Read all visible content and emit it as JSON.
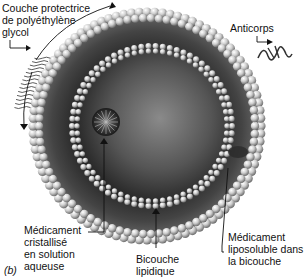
{
  "figure": {
    "panel_label": "(b)"
  },
  "labels": {
    "peg_layer": "Couche protectrice\nde polyéthylène\nglycol",
    "antibody": "Anticorps",
    "drug_aqueous": "Médicament\ncristallisé\nen solution\naqueuse",
    "bilayer": "Bicouche\nlipidique",
    "drug_lipophilic": "Médicament\nliposoluble dans\nla bicouche"
  },
  "colors": {
    "core_dark": "#1a1a1a",
    "core_mid": "#5a5a5a",
    "head_light": "#d8d8d8",
    "head_shadow": "#7a7a7a",
    "tail": "#3a3a3a",
    "text": "#111111"
  }
}
